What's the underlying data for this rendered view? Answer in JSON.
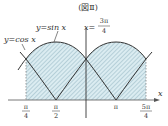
{
  "title": "(図Ⅱ)",
  "labels": {
    "sin": "y=sin x",
    "cos": "y=cos x",
    "vline_left": "x=",
    "vline_num": "3π",
    "vline_den": "4",
    "x_axis": "x"
  },
  "ticks": [
    {
      "num": "π",
      "den": "4"
    },
    {
      "num": "π",
      "den": "2"
    },
    {
      "num": "π",
      "den": ""
    },
    {
      "num": "5π",
      "den": "4"
    }
  ],
  "colors": {
    "fill": "#d4e8ee",
    "hatch": "#8fb3bf",
    "curve": "#333333"
  }
}
